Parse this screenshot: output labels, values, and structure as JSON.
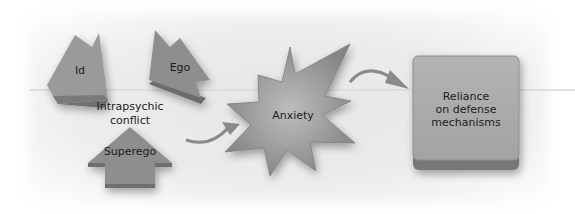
{
  "diagram": {
    "nodes": {
      "id": {
        "label": "Id"
      },
      "ego": {
        "label": "Ego"
      },
      "superego": {
        "label": "Superego"
      },
      "conflict": {
        "label_line1": "Intrapsychic",
        "label_line2": "conflict"
      },
      "anxiety": {
        "label": "Anxiety"
      },
      "defense": {
        "label_line1": "Reliance",
        "label_line2": "on defense",
        "label_line3": "mechanisms"
      }
    },
    "edges": [
      {
        "from": "Intrapsychic conflict",
        "to": "Anxiety"
      },
      {
        "from": "Anxiety",
        "to": "Reliance on defense mechanisms"
      }
    ],
    "colors": {
      "shape_fill": "#8f8f8f",
      "shape_dark": "#6e6e6e",
      "box_fill": "#a9a9a9",
      "arrow": "#8a8a8a",
      "text": "#1c1c1c"
    }
  }
}
